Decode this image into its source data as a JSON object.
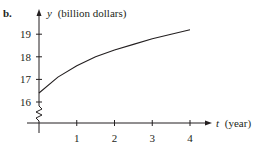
{
  "figure": {
    "panel_label": "b."
  },
  "chart_data": {
    "type": "line",
    "title": "",
    "panel": "b.",
    "xlabel_var": "t",
    "xlabel_unit": "(year)",
    "ylabel_var": "y",
    "ylabel_unit": "(billion dollars)",
    "x_ticks": [
      "1",
      "2",
      "3",
      "4"
    ],
    "y_ticks": [
      "16",
      "17",
      "18",
      "19"
    ],
    "xlim": [
      0,
      4.5
    ],
    "ylim": [
      16,
      19.6
    ],
    "y_axis_break": true,
    "grid": false,
    "legend": null,
    "series": [
      {
        "name": "y(t)",
        "x": [
          0,
          0.5,
          1,
          1.5,
          2,
          2.5,
          3,
          3.5,
          4
        ],
        "values": [
          16.4,
          17.1,
          17.6,
          18.0,
          18.3,
          18.55,
          18.8,
          19.0,
          19.2
        ]
      }
    ]
  }
}
